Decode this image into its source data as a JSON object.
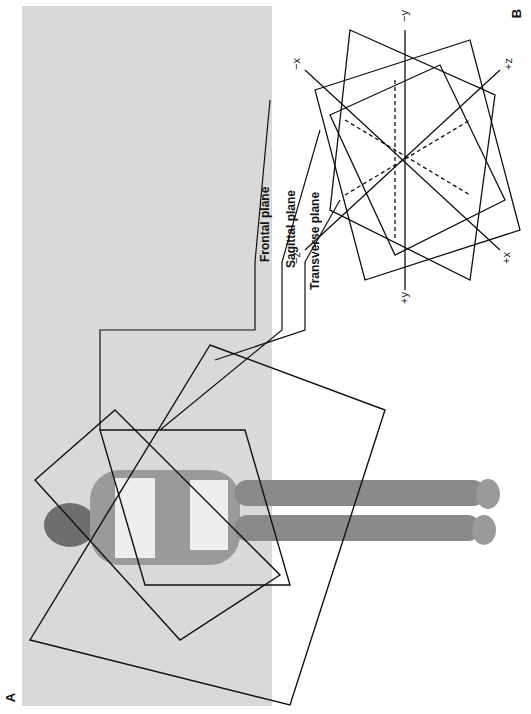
{
  "figure": {
    "panels": [
      {
        "id": "A",
        "letter": "A",
        "description": "Photograph of a reclining person with three intersecting anatomical planes overlaid"
      },
      {
        "id": "B",
        "letter": "B",
        "description": "Schematic of three intersecting planes with coordinate axes"
      }
    ],
    "plane_labels": [
      {
        "key": "frontal",
        "text": "Frontal plane"
      },
      {
        "key": "sagittal",
        "text": "Sagittal plane"
      },
      {
        "key": "transverse",
        "text": "Transverse plane"
      }
    ],
    "axes": {
      "plus_x": "+x",
      "minus_x": "−x",
      "plus_y": "+y",
      "minus_y": "−y",
      "plus_z": "+z",
      "minus_z": "−z"
    },
    "colors": {
      "line": "#111111",
      "photo_background": "#d9d9d9",
      "page_background": "#ffffff"
    }
  }
}
